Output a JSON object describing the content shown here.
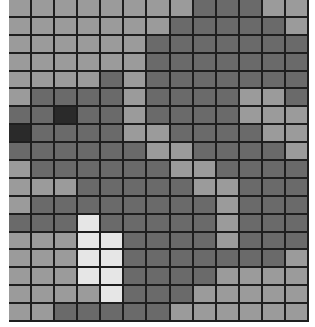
{
  "grid": {
    "cols": 13,
    "rows": 18,
    "palette": {
      "L": "#9b9b9b",
      "M": "#6a6a6a",
      "D": "#2a2a2a",
      "W": "#e6e6e6"
    },
    "line_color": "#1e1e1e",
    "cells": [
      "LLLLLLLLMMMLL",
      "LLLLLLLMMMMML",
      "LLLLLLMMMMMMM",
      "LLLLLLMMMMMMM",
      "LLLLMLMMMMMMM",
      "LMMMMLMMMMLLM",
      "MMDMMLMMMMLLL",
      "DMMMMLLMMMMLL",
      "MMMMMMLLMMMML",
      "LMMMMMMLLMMMM",
      "LLLMMMMMLLMMM",
      "LMMMMMMMMLMMM",
      "MMMWMMMMMLMMM",
      "LLLWWMMMMLMMM",
      "LLLWWMMMMMMML",
      "LLLWWMMMMLLLL",
      "LLLLWMMMLLLLL",
      "LLMMMMMLLLLLL"
    ]
  }
}
